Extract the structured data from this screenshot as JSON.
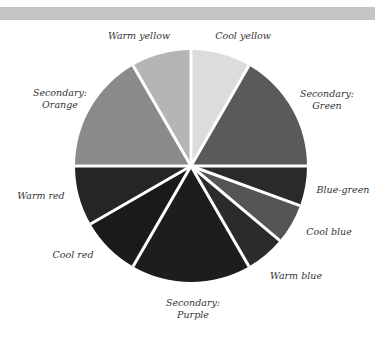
{
  "chart_data": {
    "type": "pie",
    "title": "",
    "start_angle_deg_clockwise_from_top": 0,
    "center": [
      191,
      166
    ],
    "radius": 116,
    "slices": [
      {
        "label": "Cool yellow",
        "degrees": 30,
        "color": "#dcdcdc"
      },
      {
        "label": "Secondary: Green",
        "degrees": 60,
        "color": "#5a5a5a"
      },
      {
        "label": "Blue-green",
        "degrees": 20,
        "color": "#2a2a2a"
      },
      {
        "label": "Cool blue",
        "degrees": 20,
        "color": "#555555"
      },
      {
        "label": "Warm blue",
        "degrees": 20,
        "color": "#2b2b2b"
      },
      {
        "label": "Secondary: Purple",
        "degrees": 60,
        "color": "#1d1d1d"
      },
      {
        "label": "Cool red",
        "degrees": 30,
        "color": "#1a1a1a"
      },
      {
        "label": "Warm red",
        "degrees": 30,
        "color": "#252525"
      },
      {
        "label": "Secondary: Orange",
        "degrees": 60,
        "color": "#8a8a8a"
      },
      {
        "label": "Warm yellow",
        "degrees": 30,
        "color": "#b5b5b5"
      }
    ],
    "separator_color": "#ffffff",
    "legend": "none"
  },
  "labels": {
    "warm_yellow": {
      "line1": "Warm yellow",
      "x": 139,
      "y": 36
    },
    "cool_yellow": {
      "line1": "Cool yellow",
      "x": 243,
      "y": 36
    },
    "orange": {
      "line1": "Secondary:",
      "line2": "Orange",
      "x": 60,
      "y": 99
    },
    "green": {
      "line1": "Secondary:",
      "line2": "Green",
      "x": 327,
      "y": 100
    },
    "warm_red": {
      "line1": "Warm red",
      "x": 41,
      "y": 196
    },
    "blue_green": {
      "line1": "Blue-green",
      "x": 343,
      "y": 190
    },
    "cool_blue": {
      "line1": "Cool blue",
      "x": 329,
      "y": 232
    },
    "cool_red": {
      "line1": "Cool red",
      "x": 73,
      "y": 255
    },
    "warm_blue": {
      "line1": "Warm blue",
      "x": 296,
      "y": 276
    },
    "purple": {
      "line1": "Secondary:",
      "line2": "Purple",
      "x": 193,
      "y": 309
    }
  }
}
